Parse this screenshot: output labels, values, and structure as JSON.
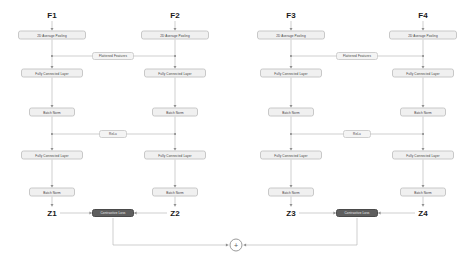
{
  "diagram": {
    "colors": {
      "background": "#ffffff",
      "node_fill": "#f0f0f0",
      "node_border": "#c8c8c8",
      "node_text": "#3d3d3d",
      "loss_fill": "#5e5e5e",
      "loss_text": "#f2f2f2",
      "wire": "#b0b0b0",
      "label_text": "#1a1a1a"
    }
  },
  "branches": [
    {
      "input_label": "F1",
      "output_label": "Z1",
      "x": 52,
      "stages": [
        {
          "name": "2D Average Pooling",
          "type": "wide",
          "y": 35
        },
        {
          "name": "Fully Connected Layer",
          "type": "fc",
          "y": 73
        },
        {
          "name": "Batch Norm",
          "type": "bn",
          "y": 112
        },
        {
          "name": "Fully Connected Layer",
          "type": "fc",
          "y": 155
        },
        {
          "name": "Batch Norm",
          "type": "bn",
          "y": 192
        }
      ]
    },
    {
      "input_label": "F2",
      "output_label": "Z2",
      "x": 175,
      "stages": [
        {
          "name": "2D Average Pooling",
          "type": "wide",
          "y": 35
        },
        {
          "name": "Fully Connected Layer",
          "type": "fc",
          "y": 73
        },
        {
          "name": "Batch Norm",
          "type": "bn",
          "y": 112
        },
        {
          "name": "Fully Connected Layer",
          "type": "fc",
          "y": 155
        },
        {
          "name": "Batch Norm",
          "type": "bn",
          "y": 192
        }
      ]
    },
    {
      "input_label": "F3",
      "output_label": "Z3",
      "x": 291,
      "stages": [
        {
          "name": "2D Average Pooling",
          "type": "wide",
          "y": 35
        },
        {
          "name": "Fully Connected Layer",
          "type": "fc",
          "y": 73
        },
        {
          "name": "Batch Norm",
          "type": "bn",
          "y": 112
        },
        {
          "name": "Fully Connected Layer",
          "type": "fc",
          "y": 155
        },
        {
          "name": "Batch Norm",
          "type": "bn",
          "y": 192
        }
      ]
    },
    {
      "input_label": "F4",
      "output_label": "Z4",
      "x": 423,
      "stages": [
        {
          "name": "2D Average Pooling",
          "type": "wide",
          "y": 35
        },
        {
          "name": "Fully Connected Layer",
          "type": "fc",
          "y": 73
        },
        {
          "name": "Batch Norm",
          "type": "bn",
          "y": 112
        },
        {
          "name": "Fully Connected Layer",
          "type": "fc",
          "y": 155
        },
        {
          "name": "Batch Norm",
          "type": "bn",
          "y": 192
        }
      ]
    }
  ],
  "cross_links": [
    {
      "label": "Flattened Features",
      "type": "flat",
      "x": 113,
      "y": 56,
      "pair": "F1-F2"
    },
    {
      "label": "ReLu",
      "type": "relu",
      "x": 113,
      "y": 134,
      "pair": "F1-F2"
    },
    {
      "label": "Flattened Features",
      "type": "flat",
      "x": 357,
      "y": 56,
      "pair": "F3-F4"
    },
    {
      "label": "ReLu",
      "type": "relu",
      "x": 357,
      "y": 134,
      "pair": "F3-F4"
    }
  ],
  "losses": [
    {
      "label": "Contrastive Loss",
      "x": 113,
      "y": 213,
      "pair": "Z1-Z2"
    },
    {
      "label": "Contrastive Loss",
      "x": 357,
      "y": 213,
      "pair": "Z3-Z4"
    }
  ],
  "aggregator": {
    "symbol": "+",
    "x": 236,
    "y": 245,
    "name": "sum-node"
  },
  "output_labels": [
    {
      "label": "Z1",
      "x": 52,
      "y": 213
    },
    {
      "label": "Z2",
      "x": 175,
      "y": 213
    },
    {
      "label": "Z3",
      "x": 291,
      "y": 213
    },
    {
      "label": "Z4",
      "x": 423,
      "y": 213
    }
  ],
  "input_labels": [
    {
      "label": "F1",
      "x": 52,
      "y": 15
    },
    {
      "label": "F2",
      "x": 175,
      "y": 15
    },
    {
      "label": "F3",
      "x": 291,
      "y": 15
    },
    {
      "label": "F4",
      "x": 423,
      "y": 15
    }
  ]
}
